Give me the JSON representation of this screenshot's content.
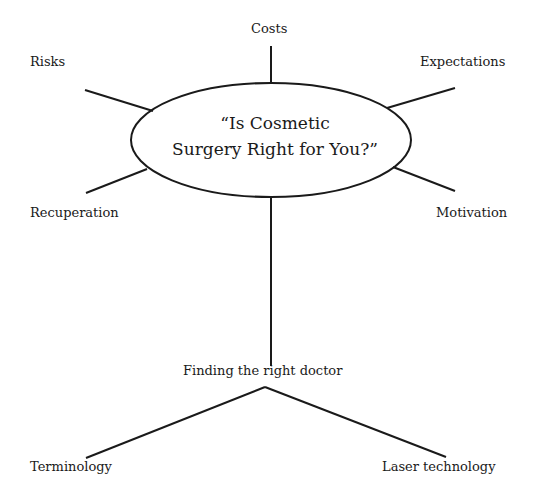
{
  "diagram": {
    "type": "mind-map",
    "central_topic": {
      "line1": "“Is Cosmetic",
      "line2": "Surgery Right for You?”"
    },
    "branches": [
      {
        "label": "Costs"
      },
      {
        "label": "Risks"
      },
      {
        "label": "Expectations"
      },
      {
        "label": "Recuperation"
      },
      {
        "label": "Motivation"
      },
      {
        "label": "Finding the right doctor",
        "children": [
          {
            "label": "Terminology"
          },
          {
            "label": "Laser technology"
          }
        ]
      }
    ],
    "colors": {
      "line": "#1a1a1a",
      "background": "#ffffff",
      "text": "#1a1a1a"
    }
  }
}
